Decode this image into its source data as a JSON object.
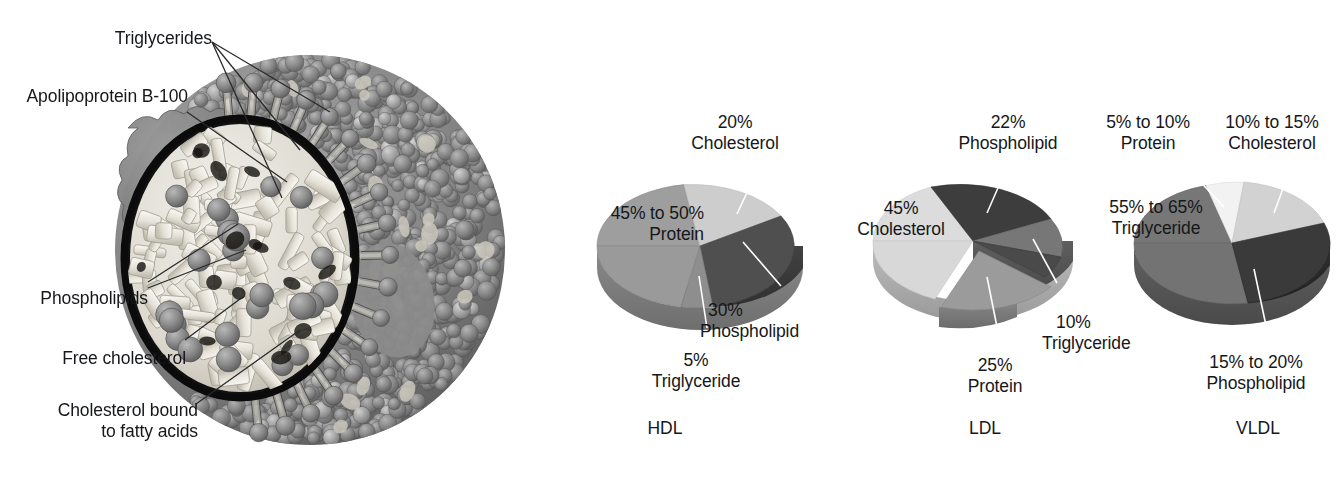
{
  "figure": {
    "particle": {
      "name": "lipoprotein-particle-cutaway",
      "labels": [
        {
          "id": "triglycerides",
          "text": "Triglycerides",
          "line2": ""
        },
        {
          "id": "apolipoprotein",
          "text": "Apolipoprotein B-100",
          "line2": ""
        },
        {
          "id": "phospholipids",
          "text": "Phospholipids",
          "line2": ""
        },
        {
          "id": "free-cholesterol",
          "text": "Free cholesterol",
          "line2": ""
        },
        {
          "id": "bound-cholesterol",
          "text": "Cholesterol bound",
          "line2": "to fatty acids"
        }
      ]
    }
  },
  "chart_data": [
    {
      "type": "pie",
      "title": "HDL",
      "categories": [
        "Cholesterol",
        "Phospholipid",
        "Triglyceride",
        "Protein"
      ],
      "values": [
        20,
        30,
        5,
        47.5
      ],
      "labels": [
        {
          "pct": "20%",
          "name": "Cholesterol"
        },
        {
          "pct": "30%",
          "name": "Phospholipid"
        },
        {
          "pct": "5%",
          "name": "Triglyceride"
        },
        {
          "pct": "45% to 50%",
          "name": "Protein"
        }
      ],
      "colors": [
        "#cdcdcd",
        "#4f4f4f",
        "#8e8e8e",
        "#9e9e9e"
      ]
    },
    {
      "type": "pie",
      "title": "LDL",
      "categories": [
        "Phospholipid",
        "Triglyceride",
        "Protein",
        "Cholesterol"
      ],
      "values": [
        22,
        10,
        25,
        45
      ],
      "labels": [
        {
          "pct": "22%",
          "name": "Phospholipid"
        },
        {
          "pct": "10%",
          "name": "Triglyceride"
        },
        {
          "pct": "25%",
          "name": "Protein"
        },
        {
          "pct": "45%",
          "name": "Cholesterol"
        }
      ],
      "colors": [
        "#3d3d3d",
        "#777777",
        "#9b9b9b",
        "#dcdcdc"
      ]
    },
    {
      "type": "pie",
      "title": "VLDL",
      "categories": [
        "Cholesterol",
        "Phospholipid",
        "Triglyceride",
        "Protein"
      ],
      "values": [
        12.5,
        17.5,
        60,
        7.5
      ],
      "labels": [
        {
          "pct": "5% to 10%",
          "name": "Protein"
        },
        {
          "pct": "10% to 15%",
          "name": "Cholesterol"
        },
        {
          "pct": "55% to 65%",
          "name": "Triglyceride"
        },
        {
          "pct": "15% to 20%",
          "name": "Phospholipid"
        }
      ],
      "colors": [
        "#d2d2d2",
        "#3a3a3a",
        "#777777",
        "#f2f2f2"
      ]
    }
  ],
  "hdl": {
    "title": "HDL",
    "chol_pct": "20%",
    "chol_name": "Cholesterol",
    "phos_pct": "30%",
    "phos_name": "Phospholipid",
    "trig_pct": "5%",
    "trig_name": "Triglyceride",
    "prot_pct": "45% to 50%",
    "prot_name": "Protein"
  },
  "ldl": {
    "title": "LDL",
    "phos_pct": "22%",
    "phos_name": "Phospholipid",
    "chol_pct": "45%",
    "chol_name": "Cholesterol",
    "prot_pct": "25%",
    "prot_name": "Protein",
    "trig_pct": "10%",
    "trig_name": "Triglyceride"
  },
  "vldl": {
    "title": "VLDL",
    "prot_pct": "5% to 10%",
    "prot_name": "Protein",
    "chol_pct": "10% to 15%",
    "chol_name": "Cholesterol",
    "trig_pct": "55% to 65%",
    "trig_name": "Triglyceride",
    "phos_pct": "15% to 20%",
    "phos_name": "Phospholipid"
  }
}
